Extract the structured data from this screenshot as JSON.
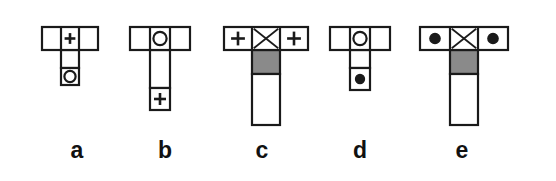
{
  "figure": {
    "name": "t-shaped-element-diagram-series",
    "background_color": "#ffffff",
    "stroke_color": "#1a1a1a",
    "fill_white": "#ffffff",
    "fill_gray": "#8a8a8a",
    "stroke_width": 2.2,
    "canvas": {
      "width": 556,
      "height": 181
    },
    "panels": [
      {
        "id": "a",
        "label": "a",
        "label_x": 77,
        "label_y": 139,
        "arm": {
          "x": 42,
          "y": 27,
          "width": 56,
          "height": 23
        },
        "arm_dividers": [
          61,
          79
        ],
        "stem": {
          "x": 61,
          "y": 50,
          "width": 18,
          "height": 35
        },
        "stem_cells": [
          {
            "y": 50,
            "height": 18,
            "fill": "#ffffff",
            "marker": "none"
          },
          {
            "y": 68,
            "height": 17,
            "fill": "#ffffff",
            "marker": "circle-open"
          }
        ],
        "arm_markers": [
          {
            "cell": 0,
            "marker": "none"
          },
          {
            "cell": 1,
            "marker": "plus"
          },
          {
            "cell": 2,
            "marker": "none"
          }
        ]
      },
      {
        "id": "b",
        "label": "b",
        "label_x": 165,
        "label_y": 139,
        "arm": {
          "x": 130,
          "y": 27,
          "width": 60,
          "height": 23
        },
        "arm_dividers": [
          150,
          170
        ],
        "stem": {
          "x": 150,
          "y": 50,
          "width": 20,
          "height": 60
        },
        "stem_cells": [
          {
            "y": 50,
            "height": 38,
            "fill": "#ffffff",
            "marker": "none"
          },
          {
            "y": 88,
            "height": 22,
            "fill": "#ffffff",
            "marker": "plus"
          }
        ],
        "arm_markers": [
          {
            "cell": 0,
            "marker": "none"
          },
          {
            "cell": 1,
            "marker": "circle-open"
          },
          {
            "cell": 2,
            "marker": "none"
          }
        ]
      },
      {
        "id": "c",
        "label": "c",
        "label_x": 262,
        "label_y": 139,
        "arm": {
          "x": 224,
          "y": 27,
          "width": 84,
          "height": 23
        },
        "arm_dividers": [
          252,
          280
        ],
        "stem": {
          "x": 252,
          "y": 50,
          "width": 28,
          "height": 75
        },
        "stem_cells": [
          {
            "y": 50,
            "height": 24,
            "fill": "#8a8a8a",
            "marker": "none"
          },
          {
            "y": 74,
            "height": 51,
            "fill": "#ffffff",
            "marker": "none"
          }
        ],
        "arm_markers": [
          {
            "cell": 0,
            "marker": "plus"
          },
          {
            "cell": 1,
            "marker": "cross-box"
          },
          {
            "cell": 2,
            "marker": "plus"
          }
        ]
      },
      {
        "id": "d",
        "label": "d",
        "label_x": 360,
        "label_y": 139,
        "arm": {
          "x": 330,
          "y": 27,
          "width": 60,
          "height": 23
        },
        "arm_dividers": [
          350,
          370
        ],
        "stem": {
          "x": 350,
          "y": 50,
          "width": 20,
          "height": 40
        },
        "stem_cells": [
          {
            "y": 50,
            "height": 18,
            "fill": "#ffffff",
            "marker": "none"
          },
          {
            "y": 68,
            "height": 22,
            "fill": "#ffffff",
            "marker": "dot-filled"
          }
        ],
        "arm_markers": [
          {
            "cell": 0,
            "marker": "none"
          },
          {
            "cell": 1,
            "marker": "circle-open"
          },
          {
            "cell": 2,
            "marker": "none"
          }
        ]
      },
      {
        "id": "e",
        "label": "e",
        "label_x": 462,
        "label_y": 139,
        "arm": {
          "x": 420,
          "y": 27,
          "width": 88,
          "height": 23
        },
        "arm_dividers": [
          450,
          478
        ],
        "stem": {
          "x": 450,
          "y": 50,
          "width": 28,
          "height": 75
        },
        "stem_cells": [
          {
            "y": 50,
            "height": 24,
            "fill": "#8a8a8a",
            "marker": "none"
          },
          {
            "y": 74,
            "height": 51,
            "fill": "#ffffff",
            "marker": "none"
          }
        ],
        "arm_markers": [
          {
            "cell": 0,
            "marker": "dot-filled"
          },
          {
            "cell": 1,
            "marker": "cross-box"
          },
          {
            "cell": 2,
            "marker": "dot-filled"
          }
        ]
      }
    ]
  }
}
